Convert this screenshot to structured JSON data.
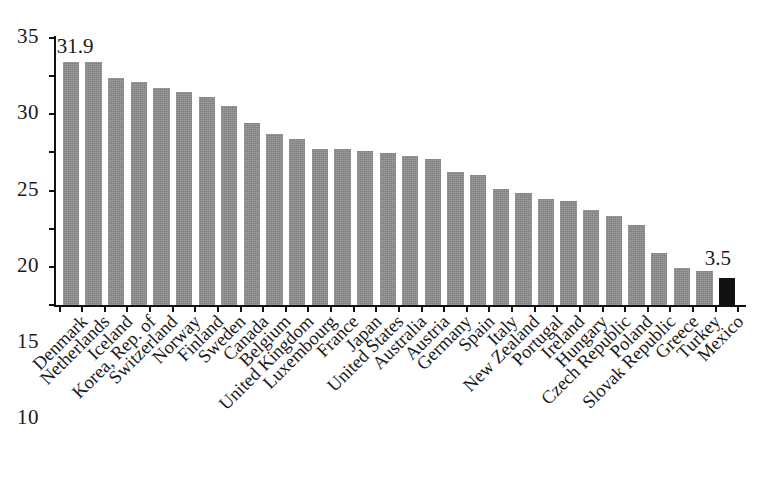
{
  "chart_data": {
    "type": "bar",
    "title": "",
    "subtitle": "",
    "xlabel": "",
    "ylabel": "",
    "ylim": [
      0,
      35
    ],
    "yticks": [
      0,
      5,
      10,
      15,
      20,
      25,
      30,
      35
    ],
    "ytick_labels": [
      "0",
      "5",
      "10",
      "15",
      "20",
      "25",
      "30",
      "35"
    ],
    "grid": false,
    "legend": null,
    "bar_color": "#7f7f7f",
    "highlight_color": "#111111",
    "highlight_category": "Mexico",
    "annotations": [
      {
        "category": "Denmark",
        "text": "31.9",
        "position": "above-left"
      },
      {
        "category": "Mexico",
        "text": "3.5",
        "position": "above"
      }
    ],
    "categories": [
      "Denmark",
      "Netherlands",
      "Iceland",
      "Korea, Rep. of",
      "Switzerland",
      "Norway",
      "Finland",
      "Sweden",
      "Canada",
      "Belgium",
      "United Kingdom",
      "Luxembourg",
      "France",
      "Japan",
      "United States",
      "Australia",
      "Austria",
      "Germany",
      "Spain",
      "Italy",
      "New Zealand",
      "Portugal",
      "Ireland",
      "Hungary",
      "Czech Republic",
      "Poland",
      "Slovak Republic",
      "Greece",
      "Turkey",
      "Mexico"
    ],
    "values": [
      31.9,
      31.9,
      29.8,
      29.2,
      28.5,
      27.9,
      27.3,
      26.1,
      23.8,
      22.4,
      21.8,
      20.4,
      20.4,
      20.2,
      19.9,
      19.5,
      19.2,
      17.4,
      17.1,
      15.2,
      14.7,
      13.9,
      13.7,
      12.4,
      11.7,
      10.5,
      6.8,
      4.8,
      4.5,
      3.5
    ]
  }
}
